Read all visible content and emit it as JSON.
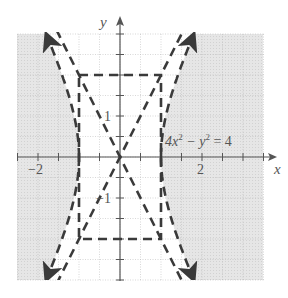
{
  "chart_data": {
    "type": "line",
    "title": "",
    "equation_label": "4x² − y² = 4",
    "equation_parts": {
      "a": "4x",
      "sup1": "2",
      "mid": " − y",
      "sup2": "2",
      "end": " = 4"
    },
    "xlabel": "x",
    "ylabel": "y",
    "xlim": [
      -2.5,
      3.5
    ],
    "ylim": [
      -3,
      3
    ],
    "x_tick_labels": [
      {
        "value": -2,
        "label": "−2"
      },
      {
        "value": 2,
        "label": "2"
      }
    ],
    "y_tick_labels": [
      {
        "value": 1,
        "label": "1"
      },
      {
        "value": -1,
        "label": "−1"
      }
    ],
    "tick_step": 0.5,
    "grid": true,
    "shaded_region": "4x² − y² ≥ 4 (outside the hyperbola branches)",
    "hyperbola": {
      "a": 1,
      "b": 2,
      "vertices": [
        [
          -1,
          0
        ],
        [
          1,
          0
        ]
      ],
      "style": "dashed"
    },
    "asymptotes": [
      {
        "equation": "y = 2x"
      },
      {
        "equation": "y = -2x"
      }
    ],
    "fundamental_rectangle": {
      "x": [
        -1,
        1
      ],
      "y": [
        -2,
        2
      ],
      "style": "dashed"
    },
    "colors": {
      "shade": "#e2e2e2",
      "curve": "#3a3a3a",
      "grid": "#bdbdbd",
      "axis": "#555555"
    }
  }
}
